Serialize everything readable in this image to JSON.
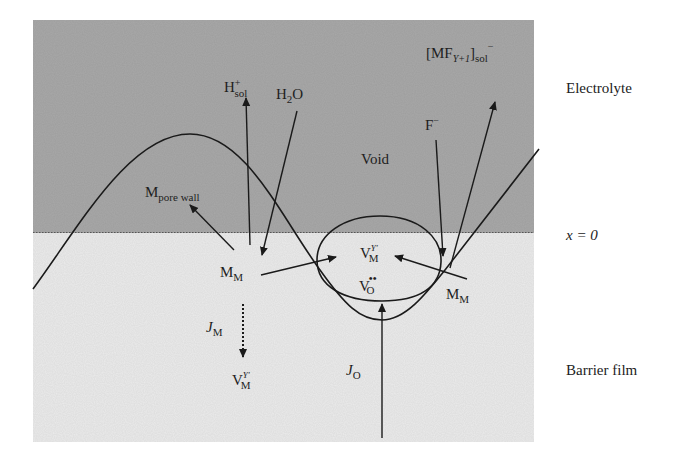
{
  "diagram": {
    "regions": {
      "electrolyte": {
        "label": "Electrolyte",
        "color": "#a9a9a9"
      },
      "barrier_film": {
        "label": "Barrier film",
        "color": "#ececec"
      },
      "interface": {
        "label": "x = 0"
      }
    },
    "labels": {
      "void": "Void",
      "h_sol": {
        "base": "H",
        "sup": "+",
        "sub": "sol"
      },
      "h2o": {
        "base": "H",
        "sub": "2",
        "tail": "O"
      },
      "mf_sol": {
        "open": "[MF",
        "sub1": "Y+1",
        "close": "]",
        "sub2": "sol",
        "sup": "−"
      },
      "f_minus": {
        "base": "F",
        "sup": "−"
      },
      "m_pore_wall": {
        "base": "M",
        "sub": "pore wall"
      },
      "m_m_left": {
        "base": "M",
        "sub": "M"
      },
      "m_m_right": {
        "base": "M",
        "sub": "M"
      },
      "v_m_void": {
        "base": "V",
        "sup": "Y′",
        "sub": "M"
      },
      "v_o": {
        "base": "V",
        "sup": "••",
        "sub": "O"
      },
      "j_m": {
        "base": "J",
        "sub": "M"
      },
      "v_m_film": {
        "base": "V",
        "sup": "Y′",
        "sub": "M"
      },
      "j_o": {
        "base": "J",
        "sub": "O"
      }
    }
  }
}
